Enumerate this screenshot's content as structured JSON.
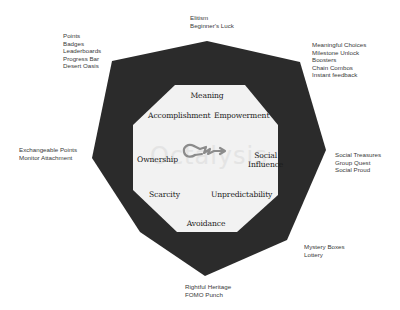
{
  "colors": {
    "outer_shape": "#2b2b2b",
    "inner_octagon": "#f2f2f2",
    "label_text": "#3a3a3a",
    "drive_text": "#1a1a1a",
    "key_icon": "#8c8c8c",
    "watermark": "#e4e4e4"
  },
  "center": {
    "icon": "key-icon",
    "watermark_text": "Octalysis"
  },
  "core_drives": {
    "meaning": "Meaning",
    "accomplishment": "Accomplishment",
    "empowerment": "Empowerment",
    "ownership": "Ownership",
    "social_line1": "Social",
    "social_line2": "Influence",
    "scarcity": "Scarcity",
    "unpredictability": "Unpredictability",
    "avoidance": "Avoidance"
  },
  "technique_groups": {
    "top": [
      "Elitism",
      "Beginner's Luck"
    ],
    "top_left": [
      "Points",
      "Badges",
      "Leaderboards",
      "Progress Bar",
      "Desert Oasis"
    ],
    "top_right": [
      "Meaningful Choices",
      "Milestone Unlock",
      "Boosters",
      "Chain Combos",
      "Instant feedback"
    ],
    "left": [
      "Exchangeable Points",
      "Monitor Attachment"
    ],
    "right": [
      "Social Treasures",
      "Group Quest",
      "Social Proud"
    ],
    "bottom_right": [
      "Mystery Boxes",
      "Lottery"
    ],
    "bottom": [
      "Rightful Heritage",
      "FOMO Punch"
    ]
  }
}
